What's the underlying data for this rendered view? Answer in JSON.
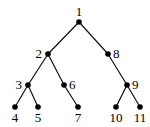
{
  "diagram": {
    "type": "tree",
    "colors": {
      "edge": "#111111",
      "node": "#000000",
      "label": "#000000",
      "background": "#ffffff"
    },
    "nodes": [
      {
        "id": "1",
        "label": "1",
        "x": 79,
        "y": 22,
        "lx": 79,
        "ly": 16,
        "anchor": "middle"
      },
      {
        "id": "2",
        "label": "2",
        "x": 48,
        "y": 54,
        "lx": 42,
        "ly": 58,
        "anchor": "end"
      },
      {
        "id": "3",
        "label": "3",
        "x": 28,
        "y": 85,
        "lx": 22,
        "ly": 89,
        "anchor": "end"
      },
      {
        "id": "4",
        "label": "4",
        "x": 15,
        "y": 107,
        "lx": 15,
        "ly": 122,
        "anchor": "middle"
      },
      {
        "id": "5",
        "label": "5",
        "x": 38,
        "y": 107,
        "lx": 38,
        "ly": 122,
        "anchor": "middle"
      },
      {
        "id": "6",
        "label": "6",
        "x": 64,
        "y": 85,
        "lx": 69,
        "ly": 89,
        "anchor": "start"
      },
      {
        "id": "7",
        "label": "7",
        "x": 78,
        "y": 107,
        "lx": 78,
        "ly": 122,
        "anchor": "middle"
      },
      {
        "id": "8",
        "label": "8",
        "x": 108,
        "y": 54,
        "lx": 113,
        "ly": 58,
        "anchor": "start"
      },
      {
        "id": "9",
        "label": "9",
        "x": 127,
        "y": 85,
        "lx": 132,
        "ly": 89,
        "anchor": "start"
      },
      {
        "id": "10",
        "label": "10",
        "x": 116,
        "y": 107,
        "lx": 116,
        "ly": 122,
        "anchor": "middle"
      },
      {
        "id": "11",
        "label": "11",
        "x": 140,
        "y": 107,
        "lx": 140,
        "ly": 122,
        "anchor": "middle"
      }
    ],
    "edges": [
      [
        "1",
        "2"
      ],
      [
        "1",
        "8"
      ],
      [
        "2",
        "3"
      ],
      [
        "2",
        "6"
      ],
      [
        "3",
        "4"
      ],
      [
        "3",
        "5"
      ],
      [
        "6",
        "7"
      ],
      [
        "8",
        "9"
      ],
      [
        "9",
        "10"
      ],
      [
        "9",
        "11"
      ]
    ]
  }
}
